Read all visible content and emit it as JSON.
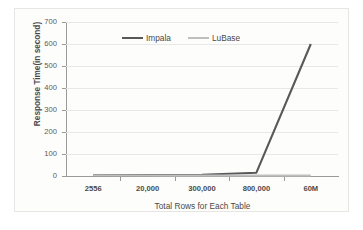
{
  "chart_data": {
    "type": "line",
    "title": "",
    "xlabel": "Total Rows for Each Table",
    "ylabel": "Response Time(in second)",
    "categories": [
      "2556",
      "20,000",
      "300,000",
      "800,000",
      "60M"
    ],
    "yticks": [
      "0",
      "100",
      "200",
      "300",
      "400",
      "500",
      "600",
      "700"
    ],
    "ylim": [
      0,
      700
    ],
    "grid": true,
    "legend_position": "top-center",
    "series": [
      {
        "name": "Impala",
        "color": "#595959",
        "values": [
          3,
          4,
          6,
          15,
          600
        ]
      },
      {
        "name": "LuBase",
        "color": "#bfbfbf",
        "values": [
          2,
          2,
          2,
          2,
          2
        ]
      }
    ]
  },
  "legend": {
    "items": [
      {
        "label": "Impala",
        "color": "#595959"
      },
      {
        "label": "LuBase",
        "color": "#bfbfbf"
      }
    ]
  }
}
